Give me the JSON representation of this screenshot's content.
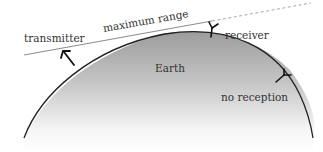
{
  "diagram": {
    "labels": {
      "transmitter": "transmitter",
      "maximum_range": "maximum range",
      "receiver": "receiver",
      "earth": "Earth",
      "no_reception": "no reception"
    },
    "colors": {
      "earth_top": "#9a9a9a",
      "earth_bottom": "#ffffff",
      "outline": "#222222",
      "range_line": "#8a8a8a",
      "text": "#333333"
    },
    "elements": [
      {
        "type": "earth-arc",
        "description": "curved Earth surface with gray gradient fill"
      },
      {
        "type": "antenna",
        "role": "transmitter",
        "shape": "arrow"
      },
      {
        "type": "antenna",
        "role": "receiver",
        "shape": "Y-fork",
        "state": "reception"
      },
      {
        "type": "antenna",
        "role": "receiver",
        "shape": "Y-fork",
        "state": "no reception"
      },
      {
        "type": "line",
        "role": "maximum range line-of-sight",
        "style": "solid then dashed"
      }
    ]
  }
}
